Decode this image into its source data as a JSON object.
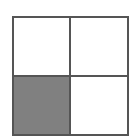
{
  "diagram": {
    "type": "grid",
    "rows": 2,
    "columns": 2,
    "border_color": "#555555",
    "cells": [
      {
        "row": 0,
        "col": 0,
        "shaded": false,
        "color": "#ffffff"
      },
      {
        "row": 0,
        "col": 1,
        "shaded": false,
        "color": "#ffffff"
      },
      {
        "row": 1,
        "col": 0,
        "shaded": true,
        "color": "#808080"
      },
      {
        "row": 1,
        "col": 1,
        "shaded": false,
        "color": "#ffffff"
      }
    ]
  }
}
